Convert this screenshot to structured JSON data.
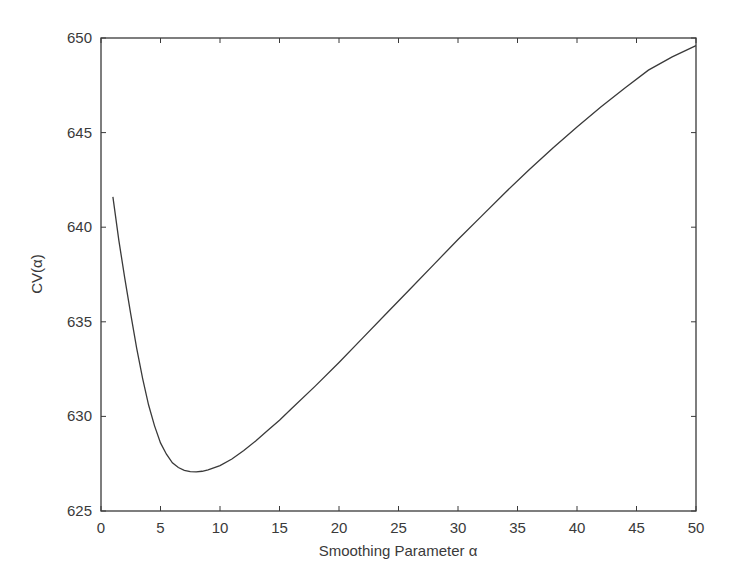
{
  "chart_data": {
    "type": "line",
    "title": "",
    "xlabel": "Smoothing Parameter α",
    "ylabel": "CV(α)",
    "xlim": [
      0,
      50
    ],
    "ylim": [
      625,
      650
    ],
    "xticks": [
      0,
      5,
      10,
      15,
      20,
      25,
      30,
      35,
      40,
      45,
      50
    ],
    "yticks": [
      625,
      630,
      635,
      640,
      645,
      650
    ],
    "grid": false,
    "legend": null,
    "series": [
      {
        "name": "CV(α)",
        "color": "#3a3a3a",
        "x": [
          1,
          1.5,
          2,
          2.5,
          3,
          3.5,
          4,
          4.5,
          5,
          5.5,
          6,
          6.5,
          7,
          7.5,
          8,
          8.5,
          9,
          10,
          11,
          12,
          13,
          14,
          15,
          16,
          18,
          20,
          22,
          24,
          26,
          28,
          30,
          32,
          34,
          36,
          38,
          40,
          42,
          44,
          46,
          48,
          50
        ],
        "y": [
          641.6,
          639.3,
          637.3,
          635.4,
          633.6,
          632.0,
          630.6,
          629.5,
          628.6,
          628.0,
          627.55,
          627.3,
          627.15,
          627.08,
          627.07,
          627.1,
          627.17,
          627.4,
          627.75,
          628.2,
          628.7,
          629.25,
          629.8,
          630.4,
          631.6,
          632.85,
          634.15,
          635.45,
          636.75,
          638.05,
          639.35,
          640.6,
          641.85,
          643.05,
          644.2,
          645.3,
          646.35,
          647.35,
          648.3,
          649.0,
          649.6
        ]
      }
    ]
  }
}
